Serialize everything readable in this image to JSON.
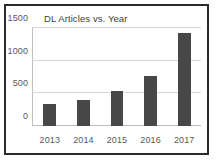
{
  "chart_data": {
    "type": "bar",
    "title": "DL Articles vs. Year",
    "xlabel": "",
    "ylabel": "",
    "categories": [
      "2013",
      "2014",
      "2015",
      "2016",
      "2017"
    ],
    "values": [
      330,
      400,
      530,
      770,
      1430
    ],
    "series": [
      {
        "name": "DL Articles",
        "values": [
          330,
          400,
          530,
          770,
          1430
        ]
      }
    ],
    "ylim": [
      0,
      1500
    ],
    "yticks": [
      0,
      500,
      1000,
      1500
    ],
    "ytick_labels": [
      "0",
      "500",
      "1000",
      "1500"
    ],
    "grid": true,
    "grid_axis": "y",
    "legend": false,
    "legend_position": "none",
    "colors": {
      "bar": "#474747",
      "gridline": "#d9d9d9",
      "axis": "#bfbfbf",
      "tick_label": "#595959",
      "title": "#404040",
      "frame": "#2b2b2b",
      "background": "#ffffff"
    }
  }
}
